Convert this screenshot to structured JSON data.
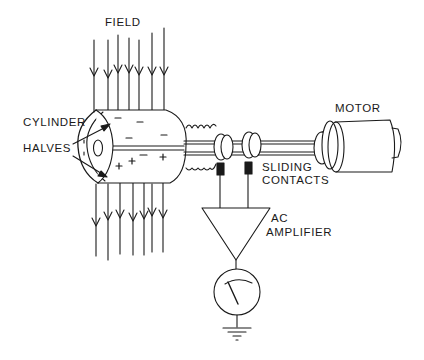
{
  "diagram": {
    "labels": {
      "field": "FIELD",
      "cylinder_halves_line1": "CYLINDER",
      "cylinder_halves_line2": "HALVES",
      "motor": "MOTOR",
      "sliding_contacts_line1": "SLIDING",
      "sliding_contacts_line2": "CONTACTS",
      "ac_amplifier_line1": "AC",
      "ac_amplifier_line2": "AMPLIFIER"
    },
    "charges": {
      "upper_half": "−",
      "lower_half": "+"
    },
    "components": [
      "field-lines",
      "split-cylinder",
      "shaft",
      "slip-rings",
      "sliding-contacts",
      "motor",
      "ac-amplifier",
      "meter",
      "ground"
    ],
    "colors": {
      "ink": "#1a1a1a",
      "background": "#ffffff"
    }
  }
}
